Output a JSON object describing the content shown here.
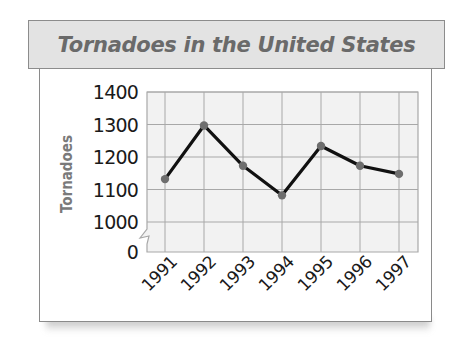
{
  "chart_data": {
    "type": "line",
    "title": "Tornadoes in the United States",
    "xlabel": "",
    "ylabel": "Tornadoes",
    "categories": [
      "1991",
      "1992",
      "1993",
      "1994",
      "1995",
      "1996",
      "1997"
    ],
    "values": [
      1132,
      1297,
      1173,
      1082,
      1234,
      1173,
      1148
    ],
    "y_ticks": [
      "0",
      "1000",
      "1100",
      "1200",
      "1300",
      "1400"
    ],
    "ylim": [
      1000,
      1400
    ],
    "axis_break": true,
    "grid": true,
    "legend": null
  },
  "colors": {
    "title_bg": "#e3e3e3",
    "title_text": "#6a6a6a",
    "grid_bg": "#f2f2f2",
    "grid_line": "#a8a8a8",
    "line": "#111111",
    "marker": "#6e6e6e",
    "tick_text": "#1a1a1a",
    "ylabel_text": "#7a7a7a"
  }
}
